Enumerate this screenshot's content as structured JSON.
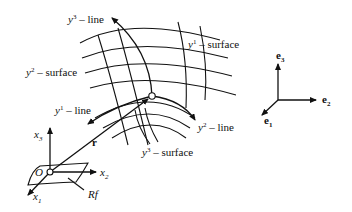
{
  "diagram": {
    "type": "curvilinear-coordinates",
    "labels": {
      "y3_line": {
        "var": "y",
        "sup": "3",
        "text": " – line"
      },
      "y1_surface": {
        "var": "y",
        "sup": "1",
        "text": " – surface"
      },
      "y2_surface": {
        "var": "y",
        "sup": "2",
        "text": " – surface"
      },
      "y1_line": {
        "var": "y",
        "sup": "1",
        "text": " – line"
      },
      "y2_line": {
        "var": "y",
        "sup": "2",
        "text": " – line"
      },
      "y3_surface": {
        "var": "y",
        "sup": "3",
        "text": " – surface"
      },
      "position_vector": "r",
      "origin": "O",
      "reference_frame": "Rf",
      "x1": {
        "var": "x",
        "sub": "1"
      },
      "x2": {
        "var": "x",
        "sub": "2"
      },
      "x3": {
        "var": "x",
        "sub": "3"
      },
      "e1": {
        "var": "e",
        "sub": "1"
      },
      "e2": {
        "var": "e",
        "sub": "2"
      },
      "e3": {
        "var": "e",
        "sub": "3"
      }
    },
    "colors": {
      "stroke": "#111111",
      "background": "#ffffff"
    }
  }
}
